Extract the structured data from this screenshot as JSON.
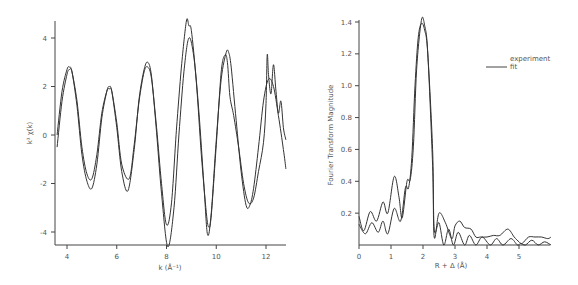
{
  "chart_data": [
    {
      "type": "line",
      "title": "",
      "xlabel": "k (Å⁻¹)",
      "ylabel": "k³ χ(k)",
      "xlim": [
        3.6,
        12.8
      ],
      "ylim": [
        -4.6,
        4.8
      ],
      "xticks": [
        4,
        6,
        8,
        10,
        12
      ],
      "yticks": [
        -4,
        -2,
        0,
        2,
        4
      ],
      "grid": false,
      "series": [
        {
          "name": "experiment",
          "x": [
            3.6,
            3.8,
            4.0,
            4.1,
            4.2,
            4.4,
            4.6,
            4.8,
            5.0,
            5.2,
            5.4,
            5.6,
            5.7,
            5.8,
            6.0,
            6.2,
            6.5,
            6.7,
            6.9,
            7.1,
            7.25,
            7.4,
            7.6,
            7.8,
            8.0,
            8.2,
            8.4,
            8.6,
            8.8,
            8.9,
            9.0,
            9.2,
            9.4,
            9.6,
            9.7,
            9.8,
            10.0,
            10.2,
            10.35,
            10.45,
            10.55,
            10.7,
            10.9,
            11.1,
            11.3,
            11.5,
            11.7,
            11.9,
            12.0,
            12.05,
            12.1,
            12.2,
            12.3,
            12.4,
            12.5,
            12.6,
            12.7,
            12.8
          ],
          "y": [
            -0.5,
            1.4,
            2.5,
            2.7,
            2.6,
            1.4,
            -0.5,
            -1.6,
            -1.8,
            -0.8,
            0.9,
            1.8,
            1.9,
            1.8,
            0.5,
            -1.2,
            -1.8,
            -0.4,
            1.4,
            2.6,
            2.8,
            2.3,
            0.3,
            -2.0,
            -3.7,
            -2.8,
            0.2,
            2.8,
            4.7,
            4.5,
            4.3,
            2.2,
            -0.8,
            -3.2,
            -3.8,
            -3.3,
            -0.4,
            2.6,
            3.3,
            3.0,
            1.6,
            0.8,
            -0.5,
            -2.0,
            -2.8,
            -2.6,
            -1.5,
            -0.3,
            1.3,
            3.3,
            2.5,
            1.7,
            2.9,
            1.8,
            0.9,
            1.4,
            0.3,
            -0.2
          ]
        },
        {
          "name": "fit",
          "x": [
            3.6,
            3.8,
            4.0,
            4.1,
            4.2,
            4.4,
            4.6,
            4.8,
            5.0,
            5.2,
            5.4,
            5.6,
            5.7,
            5.8,
            6.0,
            6.2,
            6.45,
            6.7,
            6.9,
            7.1,
            7.25,
            7.4,
            7.6,
            7.8,
            8.05,
            8.3,
            8.5,
            8.7,
            8.9,
            9.1,
            9.3,
            9.5,
            9.65,
            9.8,
            10.0,
            10.2,
            10.4,
            10.5,
            10.6,
            10.8,
            11.0,
            11.2,
            11.35,
            11.5,
            11.7,
            11.9,
            12.1,
            12.3,
            12.5,
            12.7,
            12.8
          ],
          "y": [
            0.0,
            1.8,
            2.7,
            2.8,
            2.6,
            1.2,
            -0.8,
            -1.9,
            -2.2,
            -1.2,
            0.7,
            1.8,
            2.0,
            1.8,
            0.3,
            -1.5,
            -2.3,
            -0.6,
            1.5,
            2.7,
            3.0,
            2.4,
            0.1,
            -2.4,
            -4.6,
            -3.0,
            0.0,
            2.6,
            4.0,
            3.2,
            1.0,
            -2.0,
            -4.1,
            -3.2,
            -0.2,
            2.3,
            3.4,
            3.4,
            2.8,
            0.6,
            -1.5,
            -2.9,
            -2.9,
            -2.2,
            -0.5,
            1.4,
            2.3,
            2.0,
            0.8,
            -0.6,
            -1.4
          ]
        }
      ]
    },
    {
      "type": "line",
      "title": "",
      "xlabel": "R + Δ (Å)",
      "ylabel": "Fourier Transform Magnitude",
      "xlim": [
        0,
        6.0
      ],
      "ylim": [
        0,
        1.42
      ],
      "xticks": [
        0,
        1,
        2,
        3,
        4,
        5
      ],
      "yticks": [
        0.2,
        0.4,
        0.6,
        0.8,
        1.0,
        1.2,
        1.4
      ],
      "grid": false,
      "legend": {
        "position": "upper right",
        "entries": [
          "experiment",
          "fit"
        ]
      },
      "series": [
        {
          "name": "experiment",
          "x": [
            0,
            0.15,
            0.35,
            0.55,
            0.75,
            0.9,
            1.1,
            1.25,
            1.35,
            1.5,
            1.6,
            1.7,
            1.8,
            1.95,
            2.05,
            2.15,
            2.3,
            2.35,
            2.5,
            2.7,
            2.9,
            3.0,
            3.15,
            3.3,
            3.5,
            3.65,
            3.8,
            4.0,
            4.2,
            4.4,
            4.65,
            4.85,
            5.0,
            5.1,
            5.3,
            5.5,
            5.7,
            5.9,
            6.0
          ],
          "y": [
            0.18,
            0.09,
            0.21,
            0.15,
            0.27,
            0.2,
            0.43,
            0.3,
            0.17,
            0.4,
            0.41,
            0.62,
            1.1,
            1.41,
            1.38,
            1.2,
            0.5,
            0.05,
            0.2,
            0.14,
            0.04,
            0.12,
            0.15,
            0.11,
            0.1,
            0.05,
            0.05,
            0.05,
            0.06,
            0.06,
            0.1,
            0.05,
            0.02,
            0.01,
            0.05,
            0.05,
            0.05,
            0.04,
            0.05
          ]
        },
        {
          "name": "fit",
          "x": [
            0,
            0.2,
            0.4,
            0.6,
            0.75,
            0.9,
            1.1,
            1.3,
            1.45,
            1.55,
            1.65,
            1.75,
            1.85,
            1.95,
            2.05,
            2.15,
            2.3,
            2.35,
            2.5,
            2.65,
            2.8,
            2.95,
            3.1,
            3.3,
            3.45,
            3.65,
            3.85,
            4.1,
            4.3,
            4.5,
            4.75,
            4.95,
            5.05,
            5.2,
            5.4,
            5.6,
            5.8,
            6.0
          ],
          "y": [
            0.13,
            0.07,
            0.14,
            0.08,
            0.15,
            0.07,
            0.23,
            0.15,
            0.36,
            0.36,
            0.55,
            1.0,
            1.3,
            1.39,
            1.35,
            1.2,
            0.6,
            0.1,
            0.14,
            0.0,
            0.1,
            0.0,
            0.08,
            0.0,
            0.06,
            0.0,
            0.05,
            0.0,
            0.04,
            0.0,
            0.04,
            0.0,
            0.01,
            0.0,
            0.03,
            0.0,
            0.02,
            0.0
          ]
        }
      ]
    }
  ],
  "left_chart": {
    "ylabel": "k³ χ(k)",
    "xlabel": "k (Å⁻¹)",
    "xticks": [
      "4",
      "6",
      "8",
      "10",
      "12"
    ],
    "yticks": [
      "4",
      "2",
      "0",
      "-2",
      "-4"
    ]
  },
  "right_chart": {
    "ylabel": "Fourier Transform Magnitude",
    "xlabel": "R + Δ (Å)",
    "xticks": [
      "0",
      "1",
      "2",
      "3",
      "4",
      "5"
    ],
    "yticks": [
      "1.4",
      "1.2",
      "1.0",
      "0.8",
      "0.6",
      "0.4",
      "0.2"
    ],
    "legend": {
      "experiment": "experiment",
      "fit": "fit"
    }
  }
}
